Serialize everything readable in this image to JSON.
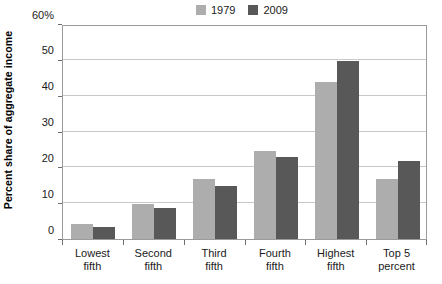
{
  "chart_data": {
    "type": "bar",
    "title": "",
    "subtitle": "",
    "xlabel": "",
    "ylabel": "Percent share of aggregate income",
    "ylim": [
      0,
      60
    ],
    "yticks": [
      0,
      10,
      20,
      30,
      40,
      50,
      60
    ],
    "ytick_labels": [
      "0",
      "10",
      "20",
      "30",
      "40",
      "50",
      "60%"
    ],
    "grid": true,
    "legend_position": "top-right",
    "categories": [
      "Lowest fifth",
      "Second fifth",
      "Third fifth",
      "Fourth fifth",
      "Highest fifth",
      "Top 5 percent"
    ],
    "category_lines": [
      [
        "Lowest",
        "fifth"
      ],
      [
        "Second",
        "fifth"
      ],
      [
        "Third",
        "fifth"
      ],
      [
        "Fourth",
        "fifth"
      ],
      [
        "Highest",
        "fifth"
      ],
      [
        "Top 5",
        "percent"
      ]
    ],
    "series": [
      {
        "name": "1979",
        "color": "#adadad",
        "values": [
          4.1,
          9.8,
          16.8,
          24.7,
          43.9,
          16.8
        ]
      },
      {
        "name": "2009",
        "color": "#585858",
        "values": [
          3.4,
          8.6,
          14.8,
          23.0,
          49.7,
          21.8
        ]
      }
    ]
  },
  "legend": {
    "items": [
      {
        "label": "1979",
        "color": "#adadad"
      },
      {
        "label": "2009",
        "color": "#585858"
      }
    ]
  },
  "axes": {
    "y_title": "Percent share of aggregate income"
  },
  "colors": {
    "series_1979": "#adadad",
    "series_2009": "#585858",
    "gridline": "#c8c8c8",
    "frame": "#9a9a9a",
    "text": "#1a1a1a",
    "background": "#ffffff"
  }
}
